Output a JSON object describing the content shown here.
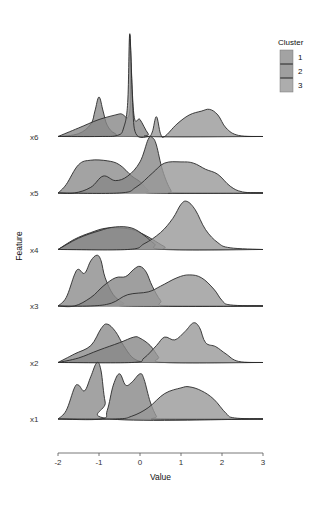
{
  "chart_data": {
    "type": "ridgeline",
    "title": "",
    "xlabel": "Value",
    "ylabel": "Feature",
    "xlim": [
      -2,
      3
    ],
    "x_ticks": [
      -2,
      -1,
      0,
      1,
      2,
      3
    ],
    "x_tick_labels": [
      "-2",
      "-1",
      "0",
      "1",
      "2",
      "3"
    ],
    "grid": false,
    "legend": {
      "title": "Cluster",
      "placement": "top-right",
      "entries": [
        "1",
        "2",
        "3"
      ]
    },
    "fill_colors": {
      "1": "#8c8c8c",
      "2": "#878787",
      "3": "#999999"
    },
    "fill_opacity": 0.8,
    "rows": [
      {
        "feature": "x1",
        "series": [
          {
            "cluster": "1",
            "points": [
              [
                -2.0,
                0.0
              ],
              [
                -1.8,
                0.15
              ],
              [
                -1.6,
                0.55
              ],
              [
                -1.5,
                0.6
              ],
              [
                -1.35,
                0.5
              ],
              [
                -1.2,
                0.75
              ],
              [
                -1.05,
                1.0
              ],
              [
                -0.95,
                0.85
              ],
              [
                -0.85,
                0.3
              ],
              [
                -0.7,
                0.0
              ]
            ]
          },
          {
            "cluster": "2",
            "points": [
              [
                -0.95,
                0.0
              ],
              [
                -0.8,
                0.15
              ],
              [
                -0.65,
                0.6
              ],
              [
                -0.5,
                0.8
              ],
              [
                -0.35,
                0.6
              ],
              [
                -0.2,
                0.65
              ],
              [
                0.0,
                0.8
              ],
              [
                0.1,
                0.7
              ],
              [
                0.25,
                0.3
              ],
              [
                0.4,
                0.05
              ],
              [
                0.5,
                0.0
              ]
            ]
          },
          {
            "cluster": "3",
            "points": [
              [
                -0.6,
                0.0
              ],
              [
                -0.2,
                0.05
              ],
              [
                0.2,
                0.2
              ],
              [
                0.6,
                0.45
              ],
              [
                1.0,
                0.55
              ],
              [
                1.2,
                0.57
              ],
              [
                1.5,
                0.5
              ],
              [
                1.8,
                0.35
              ],
              [
                2.1,
                0.1
              ],
              [
                2.3,
                0.02
              ],
              [
                3.0,
                0.0
              ]
            ]
          }
        ]
      },
      {
        "feature": "x2",
        "series": [
          {
            "cluster": "1",
            "points": [
              [
                -2.0,
                0.0
              ],
              [
                -1.6,
                0.15
              ],
              [
                -1.2,
                0.3
              ],
              [
                -0.95,
                0.6
              ],
              [
                -0.8,
                0.68
              ],
              [
                -0.6,
                0.55
              ],
              [
                -0.4,
                0.3
              ],
              [
                -0.2,
                0.1
              ],
              [
                0.0,
                0.02
              ],
              [
                0.2,
                0.0
              ]
            ]
          },
          {
            "cluster": "2",
            "points": [
              [
                -2.0,
                0.0
              ],
              [
                -1.5,
                0.08
              ],
              [
                -1.0,
                0.22
              ],
              [
                -0.5,
                0.35
              ],
              [
                -0.15,
                0.45
              ],
              [
                0.0,
                0.43
              ],
              [
                0.25,
                0.3
              ],
              [
                0.45,
                0.1
              ],
              [
                0.6,
                0.0
              ]
            ]
          },
          {
            "cluster": "3",
            "points": [
              [
                -0.2,
                0.0
              ],
              [
                0.1,
                0.08
              ],
              [
                0.4,
                0.3
              ],
              [
                0.6,
                0.45
              ],
              [
                0.85,
                0.4
              ],
              [
                1.1,
                0.55
              ],
              [
                1.3,
                0.7
              ],
              [
                1.45,
                0.62
              ],
              [
                1.6,
                0.35
              ],
              [
                1.85,
                0.28
              ],
              [
                2.1,
                0.15
              ],
              [
                2.4,
                0.02
              ],
              [
                3.0,
                0.0
              ]
            ]
          }
        ]
      },
      {
        "feature": "x3",
        "series": [
          {
            "cluster": "1",
            "points": [
              [
                -2.0,
                0.0
              ],
              [
                -1.8,
                0.15
              ],
              [
                -1.6,
                0.55
              ],
              [
                -1.5,
                0.65
              ],
              [
                -1.35,
                0.58
              ],
              [
                -1.2,
                0.8
              ],
              [
                -1.05,
                0.9
              ],
              [
                -0.95,
                0.8
              ],
              [
                -0.85,
                0.5
              ],
              [
                -0.65,
                0.2
              ],
              [
                -0.4,
                0.05
              ],
              [
                -0.2,
                0.0
              ]
            ]
          },
          {
            "cluster": "2",
            "points": [
              [
                -1.6,
                0.0
              ],
              [
                -1.2,
                0.15
              ],
              [
                -0.9,
                0.35
              ],
              [
                -0.6,
                0.5
              ],
              [
                -0.35,
                0.52
              ],
              [
                -0.15,
                0.65
              ],
              [
                0.0,
                0.7
              ],
              [
                0.15,
                0.6
              ],
              [
                0.3,
                0.35
              ],
              [
                0.5,
                0.1
              ],
              [
                0.7,
                0.0
              ]
            ]
          },
          {
            "cluster": "3",
            "points": [
              [
                -1.2,
                0.0
              ],
              [
                -0.7,
                0.05
              ],
              [
                -0.3,
                0.2
              ],
              [
                0.2,
                0.25
              ],
              [
                0.5,
                0.35
              ],
              [
                0.9,
                0.5
              ],
              [
                1.2,
                0.55
              ],
              [
                1.5,
                0.5
              ],
              [
                1.8,
                0.3
              ],
              [
                2.0,
                0.1
              ],
              [
                2.2,
                0.02
              ],
              [
                3.0,
                0.0
              ]
            ]
          }
        ]
      },
      {
        "feature": "x4",
        "series": [
          {
            "cluster": "1",
            "points": [
              [
                -2.0,
                0.0
              ],
              [
                -1.6,
                0.18
              ],
              [
                -1.2,
                0.3
              ],
              [
                -0.8,
                0.38
              ],
              [
                -0.3,
                0.37
              ],
              [
                0.0,
                0.3
              ],
              [
                0.3,
                0.18
              ],
              [
                0.6,
                0.05
              ],
              [
                0.8,
                0.0
              ]
            ]
          },
          {
            "cluster": "2",
            "points": [
              [
                -2.0,
                0.0
              ],
              [
                -1.5,
                0.2
              ],
              [
                -1.0,
                0.33
              ],
              [
                -0.6,
                0.4
              ],
              [
                -0.2,
                0.38
              ],
              [
                0.1,
                0.25
              ],
              [
                0.35,
                0.1
              ],
              [
                0.6,
                0.0
              ]
            ]
          },
          {
            "cluster": "3",
            "points": [
              [
                -0.3,
                0.0
              ],
              [
                0.1,
                0.1
              ],
              [
                0.5,
                0.3
              ],
              [
                0.8,
                0.55
              ],
              [
                1.0,
                0.8
              ],
              [
                1.15,
                0.85
              ],
              [
                1.35,
                0.7
              ],
              [
                1.6,
                0.35
              ],
              [
                1.9,
                0.12
              ],
              [
                2.2,
                0.03
              ],
              [
                3.0,
                0.0
              ]
            ]
          }
        ]
      },
      {
        "feature": "x5",
        "series": [
          {
            "cluster": "1",
            "points": [
              [
                -2.0,
                0.0
              ],
              [
                -1.8,
                0.15
              ],
              [
                -1.5,
                0.5
              ],
              [
                -1.2,
                0.58
              ],
              [
                -0.8,
                0.57
              ],
              [
                -0.5,
                0.5
              ],
              [
                -0.2,
                0.3
              ],
              [
                0.0,
                0.2
              ],
              [
                0.2,
                0.05
              ],
              [
                0.4,
                0.0
              ]
            ]
          },
          {
            "cluster": "2",
            "points": [
              [
                -1.6,
                0.0
              ],
              [
                -1.2,
                0.1
              ],
              [
                -0.9,
                0.3
              ],
              [
                -0.6,
                0.22
              ],
              [
                -0.3,
                0.3
              ],
              [
                0.0,
                0.55
              ],
              [
                0.2,
                0.95
              ],
              [
                0.3,
                0.98
              ],
              [
                0.4,
                0.85
              ],
              [
                0.55,
                0.4
              ],
              [
                0.75,
                0.05
              ],
              [
                0.9,
                0.0
              ]
            ]
          },
          {
            "cluster": "3",
            "points": [
              [
                -0.5,
                0.0
              ],
              [
                -0.1,
                0.1
              ],
              [
                0.3,
                0.35
              ],
              [
                0.6,
                0.53
              ],
              [
                1.0,
                0.55
              ],
              [
                1.3,
                0.53
              ],
              [
                1.6,
                0.42
              ],
              [
                1.9,
                0.33
              ],
              [
                2.2,
                0.12
              ],
              [
                2.5,
                0.02
              ],
              [
                3.0,
                0.0
              ]
            ]
          }
        ]
      },
      {
        "feature": "x6",
        "series": [
          {
            "cluster": "1",
            "points": [
              [
                -2.0,
                0.0
              ],
              [
                -1.5,
                0.05
              ],
              [
                -1.2,
                0.22
              ],
              [
                -1.1,
                0.45
              ],
              [
                -1.0,
                0.7
              ],
              [
                -0.9,
                0.45
              ],
              [
                -0.8,
                0.2
              ],
              [
                -0.6,
                0.05
              ],
              [
                -0.2,
                0.0
              ]
            ]
          },
          {
            "cluster": "2",
            "points": [
              [
                -2.0,
                0.0
              ],
              [
                -1.5,
                0.15
              ],
              [
                -1.0,
                0.3
              ],
              [
                -0.5,
                0.4
              ],
              [
                -0.25,
                0.45
              ],
              [
                -0.25,
                1.8
              ],
              [
                -0.15,
                0.4
              ],
              [
                0.0,
                0.3
              ],
              [
                0.2,
                0.05
              ],
              [
                0.35,
                0.0
              ]
            ]
          },
          {
            "cluster": "3",
            "points": [
              [
                -2.0,
                0.0
              ],
              [
                -1.0,
                0.0
              ],
              [
                -0.55,
                0.02
              ],
              [
                -0.4,
                0.15
              ],
              [
                -0.3,
                0.6
              ],
              [
                -0.25,
                1.82
              ],
              [
                -0.18,
                0.6
              ],
              [
                -0.1,
                0.05
              ],
              [
                0.2,
                0.0
              ],
              [
                0.3,
                0.08
              ],
              [
                0.4,
                0.35
              ],
              [
                0.5,
                0.05
              ],
              [
                0.6,
                0.0
              ],
              [
                0.9,
                0.22
              ],
              [
                1.2,
                0.38
              ],
              [
                1.5,
                0.45
              ],
              [
                1.7,
                0.48
              ],
              [
                1.9,
                0.38
              ],
              [
                2.1,
                0.15
              ],
              [
                2.4,
                0.02
              ],
              [
                3.0,
                0.0
              ]
            ]
          }
        ]
      }
    ]
  }
}
